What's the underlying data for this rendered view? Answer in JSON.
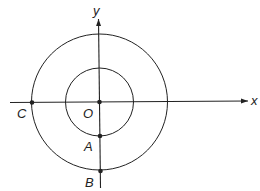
{
  "diagram": {
    "type": "concentric circles on coordinate axes",
    "axes": {
      "x_label": "x",
      "y_label": "y",
      "origin_label": "O"
    },
    "circles": [
      {
        "name": "inner-circle",
        "center": "O",
        "radius_px": 34
      },
      {
        "name": "outer-circle",
        "center": "O",
        "radius_px": 68
      }
    ],
    "points": [
      {
        "label": "O",
        "description": "origin, center of both circles"
      },
      {
        "label": "A",
        "description": "inner circle ∩ negative y-axis"
      },
      {
        "label": "B",
        "description": "outer circle ∩ negative y-axis"
      },
      {
        "label": "C",
        "description": "outer circle ∩ negative x-axis"
      }
    ],
    "colors": {
      "stroke": "#222222",
      "background": "#ffffff"
    }
  }
}
